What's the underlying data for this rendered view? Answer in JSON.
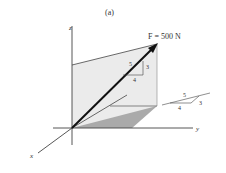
{
  "figure_label": "(a)",
  "force_label": "F = 500 N",
  "axes": {
    "x": "x",
    "y": "y",
    "z": "z"
  },
  "slope_triangle_vertical": {
    "hyp": "5",
    "side": "3",
    "base": "4"
  },
  "slope_triangle_horizontal": {
    "hyp": "5",
    "side": "3",
    "base": "4"
  }
}
